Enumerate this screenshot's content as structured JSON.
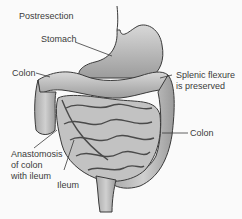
{
  "title": "Postresection",
  "labels": {
    "stomach": "Stomach",
    "colon_left": "Colon",
    "splenic_line1": "Splenic flexure",
    "splenic_line2": "is preserved",
    "colon_right": "Colon",
    "anastomosis_line1": "Anastomosis",
    "anastomosis_line2": "of colon",
    "anastomosis_line3": "with ileum",
    "ileum": "Ileum"
  },
  "colors": {
    "background": "#fafafa",
    "organ_fill": "#c4c4c4",
    "organ_shade": "#9a9a9a",
    "outline": "#3a3a3a",
    "text": "#3a3a3a"
  }
}
